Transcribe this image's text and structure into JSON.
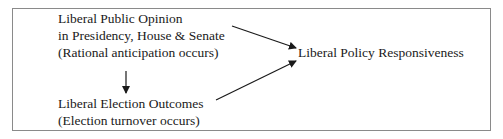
{
  "diagram": {
    "nodes": {
      "public_opinion": {
        "line1": "Liberal Public Opinion",
        "line2": "in Presidency, House & Senate",
        "line3": "(Rational anticipation occurs)"
      },
      "election_outcomes": {
        "line1": "Liberal Election Outcomes",
        "line2": "(Election turnover occurs)"
      },
      "policy_responsiveness": {
        "line1": "Liberal Policy Responsiveness"
      }
    },
    "edges": [
      {
        "from": "public_opinion",
        "to": "election_outcomes"
      },
      {
        "from": "public_opinion",
        "to": "policy_responsiveness"
      },
      {
        "from": "election_outcomes",
        "to": "policy_responsiveness"
      }
    ],
    "colors": {
      "border": "#8a8a8a",
      "arrow": "#1a1a1a",
      "text": "#1a1a1a"
    }
  }
}
